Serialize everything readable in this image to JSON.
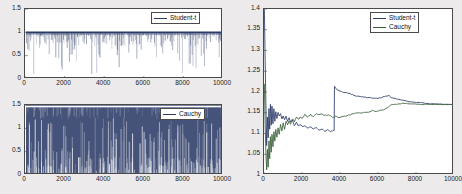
{
  "figure": {
    "background_color": "#eceaea",
    "colors": {
      "student_t": "#2b3a67",
      "cauchy": "#3a5f3a",
      "axis": "#4a4a4a",
      "plot_bg": "#ffffff"
    }
  },
  "chart_data": [
    {
      "type": "line",
      "name": "trace-student-t",
      "title": "",
      "xlabel": "",
      "ylabel": "",
      "xlim": [
        0,
        10000
      ],
      "ylim": [
        0,
        1.5
      ],
      "xticks": [
        0,
        2000,
        4000,
        6000,
        8000,
        10000
      ],
      "xticklabels": [
        "0",
        "2000",
        "4000",
        "6000",
        "8000",
        "10000"
      ],
      "yticks": [
        0,
        0.5,
        1,
        1.5
      ],
      "yticklabels": [
        "0",
        "0.5",
        "1",
        "1.5"
      ],
      "grid": false,
      "legend": [
        "Student-t"
      ],
      "legend_position": "top-right",
      "description": "MCMC acceptance trace: solid band at 1 with dense downward spikes",
      "series": [
        {
          "name": "Student-t",
          "color": "#2b3a67",
          "baseline": 1.0,
          "spike_count": 300,
          "spike_min": 0.02,
          "spike_typical_min": 0.55
        }
      ]
    },
    {
      "type": "line",
      "name": "trace-cauchy",
      "title": "",
      "xlabel": "",
      "ylabel": "",
      "xlim": [
        0,
        10000
      ],
      "ylim": [
        0,
        1.5
      ],
      "xticks": [
        0,
        2000,
        4000,
        6000,
        8000,
        10000
      ],
      "xticklabels": [
        "0",
        "2000",
        "4000",
        "6000",
        "8000",
        "10000"
      ],
      "yticks": [
        0,
        0.5,
        1,
        1.5
      ],
      "yticklabels": [
        "0",
        "0.5",
        "1",
        "1.5"
      ],
      "grid": false,
      "legend": [
        "Cauchy"
      ],
      "legend_position": "top-right",
      "description": "MCMC trace densely filling 0 to 1.5 with sparse light streaks",
      "series": [
        {
          "name": "Cauchy",
          "color": "#2b3a67",
          "baseline": 1.5,
          "fill_top": 1.45,
          "fill_bottom": 0.0,
          "streak_count": 260
        }
      ]
    },
    {
      "type": "line",
      "name": "ergodic-average",
      "title": "",
      "xlabel": "",
      "ylabel": "",
      "xlim": [
        0,
        10000
      ],
      "ylim": [
        1.0,
        1.4
      ],
      "xticks": [
        0,
        2000,
        4000,
        6000,
        8000,
        10000
      ],
      "xticklabels": [
        "0",
        "2000",
        "4000",
        "6000",
        "8000",
        "10000"
      ],
      "yticks": [
        1,
        1.05,
        1.1,
        1.15,
        1.2,
        1.25,
        1.3,
        1.35,
        1.4
      ],
      "yticklabels": [
        "1",
        "1.05",
        "1.1",
        "1.15",
        "1.2",
        "1.25",
        "1.3",
        "1.35",
        "1.4"
      ],
      "grid": false,
      "legend": [
        "Student-t",
        "Cauchy"
      ],
      "legend_position": "top-right",
      "series": [
        {
          "name": "Student-t",
          "color": "#2b3a67",
          "x": [
            20,
            60,
            100,
            140,
            180,
            220,
            260,
            300,
            340,
            380,
            420,
            470,
            520,
            570,
            620,
            680,
            740,
            800,
            870,
            940,
            1010,
            1080,
            1160,
            1240,
            1320,
            1400,
            1500,
            1600,
            1700,
            1800,
            1900,
            2000,
            2150,
            2300,
            2450,
            2600,
            2750,
            2900,
            3050,
            3200,
            3350,
            3500,
            3650,
            3690,
            3710,
            3750,
            3850,
            4000,
            4200,
            4400,
            4600,
            4800,
            5000,
            5200,
            5400,
            5600,
            5800,
            6000,
            6200,
            6400,
            6600,
            6700,
            6900,
            7100,
            7300,
            7500,
            7700,
            7900,
            8100,
            8300,
            8500,
            8700,
            8900,
            9100,
            9300,
            9500,
            9700,
            10000
          ],
          "y": [
            1.4,
            1.28,
            1.17,
            1.07,
            1.14,
            1.09,
            1.16,
            1.11,
            1.17,
            1.12,
            1.165,
            1.125,
            1.16,
            1.13,
            1.155,
            1.135,
            1.15,
            1.14,
            1.148,
            1.138,
            1.145,
            1.135,
            1.142,
            1.13,
            1.138,
            1.125,
            1.132,
            1.12,
            1.128,
            1.118,
            1.124,
            1.115,
            1.12,
            1.112,
            1.118,
            1.11,
            1.115,
            1.108,
            1.112,
            1.107,
            1.11,
            1.106,
            1.108,
            1.107,
            1.214,
            1.212,
            1.205,
            1.202,
            1.198,
            1.196,
            1.194,
            1.192,
            1.19,
            1.189,
            1.188,
            1.187,
            1.186,
            1.185,
            1.188,
            1.19,
            1.192,
            1.186,
            1.184,
            1.182,
            1.18,
            1.178,
            1.177,
            1.176,
            1.175,
            1.174,
            1.173,
            1.172,
            1.172,
            1.171,
            1.171,
            1.17,
            1.17,
            1.17
          ]
        },
        {
          "name": "Cauchy",
          "color": "#3a5f3a",
          "x": [
            20,
            60,
            100,
            140,
            180,
            220,
            260,
            300,
            340,
            380,
            420,
            470,
            520,
            570,
            620,
            680,
            740,
            800,
            870,
            940,
            1010,
            1080,
            1160,
            1240,
            1320,
            1400,
            1500,
            1600,
            1700,
            1800,
            1900,
            2000,
            2150,
            2300,
            2450,
            2600,
            2750,
            2900,
            3050,
            3200,
            3350,
            3500,
            3650,
            3800,
            3950,
            4100,
            4300,
            4500,
            4700,
            4900,
            5100,
            5300,
            5500,
            5700,
            5900,
            6100,
            6300,
            6500,
            6650,
            6750,
            6900,
            7100,
            7300,
            7500,
            7700,
            7900,
            8100,
            8300,
            8500,
            8700,
            8900,
            9100,
            9300,
            9500,
            9700,
            10000
          ],
          "y": [
            1.22,
            1.12,
            1.05,
            1.01,
            1.06,
            1.02,
            1.08,
            1.04,
            1.09,
            1.055,
            1.1,
            1.07,
            1.105,
            1.082,
            1.11,
            1.09,
            1.115,
            1.1,
            1.12,
            1.105,
            1.125,
            1.112,
            1.128,
            1.118,
            1.132,
            1.122,
            1.135,
            1.128,
            1.138,
            1.132,
            1.141,
            1.136,
            1.144,
            1.139,
            1.146,
            1.141,
            1.148,
            1.143,
            1.147,
            1.142,
            1.145,
            1.141,
            1.14,
            1.142,
            1.138,
            1.14,
            1.143,
            1.146,
            1.149,
            1.151,
            1.148,
            1.15,
            1.152,
            1.155,
            1.153,
            1.156,
            1.158,
            1.162,
            1.168,
            1.17,
            1.171,
            1.171,
            1.172,
            1.172,
            1.171,
            1.171,
            1.171,
            1.17,
            1.17,
            1.17,
            1.17,
            1.17,
            1.17,
            1.17,
            1.17,
            1.17
          ]
        }
      ]
    }
  ]
}
